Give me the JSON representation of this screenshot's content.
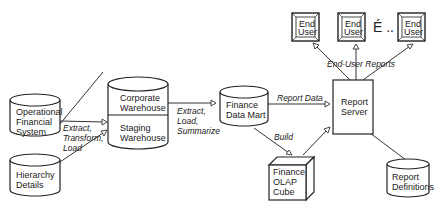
{
  "diagram": {
    "nodes": {
      "operational": {
        "line1": "Operational",
        "line2": "Financial",
        "line3": "System"
      },
      "hierarchy": {
        "line1": "Hierarchy",
        "line2": "Details"
      },
      "corporate": {
        "line1": "Corporate",
        "line2": "Warehouse"
      },
      "staging": {
        "line1": "Staging",
        "line2": "Warehouse"
      },
      "datamart": {
        "line1": "Finance",
        "line2": "Data Mart"
      },
      "olap": {
        "line1": "Finance",
        "line2": "OLAP",
        "line3": "Cube"
      },
      "server": {
        "line1": "Report",
        "line2": "Server"
      },
      "definitions": {
        "line1": "Report",
        "line2": "Definitions"
      },
      "enduser1": {
        "line1": "End",
        "line2": "User"
      },
      "enduser2": {
        "line1": "End",
        "line2": "User"
      },
      "enduser3": {
        "line1": "End",
        "line2": "User"
      },
      "ellipsis": "É .."
    },
    "edges": {
      "etl": {
        "line1": "Extract,",
        "line2": "Transform,",
        "line3": "Load"
      },
      "els": {
        "line1": "Extract,",
        "line2": "Load,",
        "line3": "Summarize"
      },
      "report_data": "Report Data",
      "build": "Build",
      "end_user_reports": "End-User Reports"
    }
  }
}
